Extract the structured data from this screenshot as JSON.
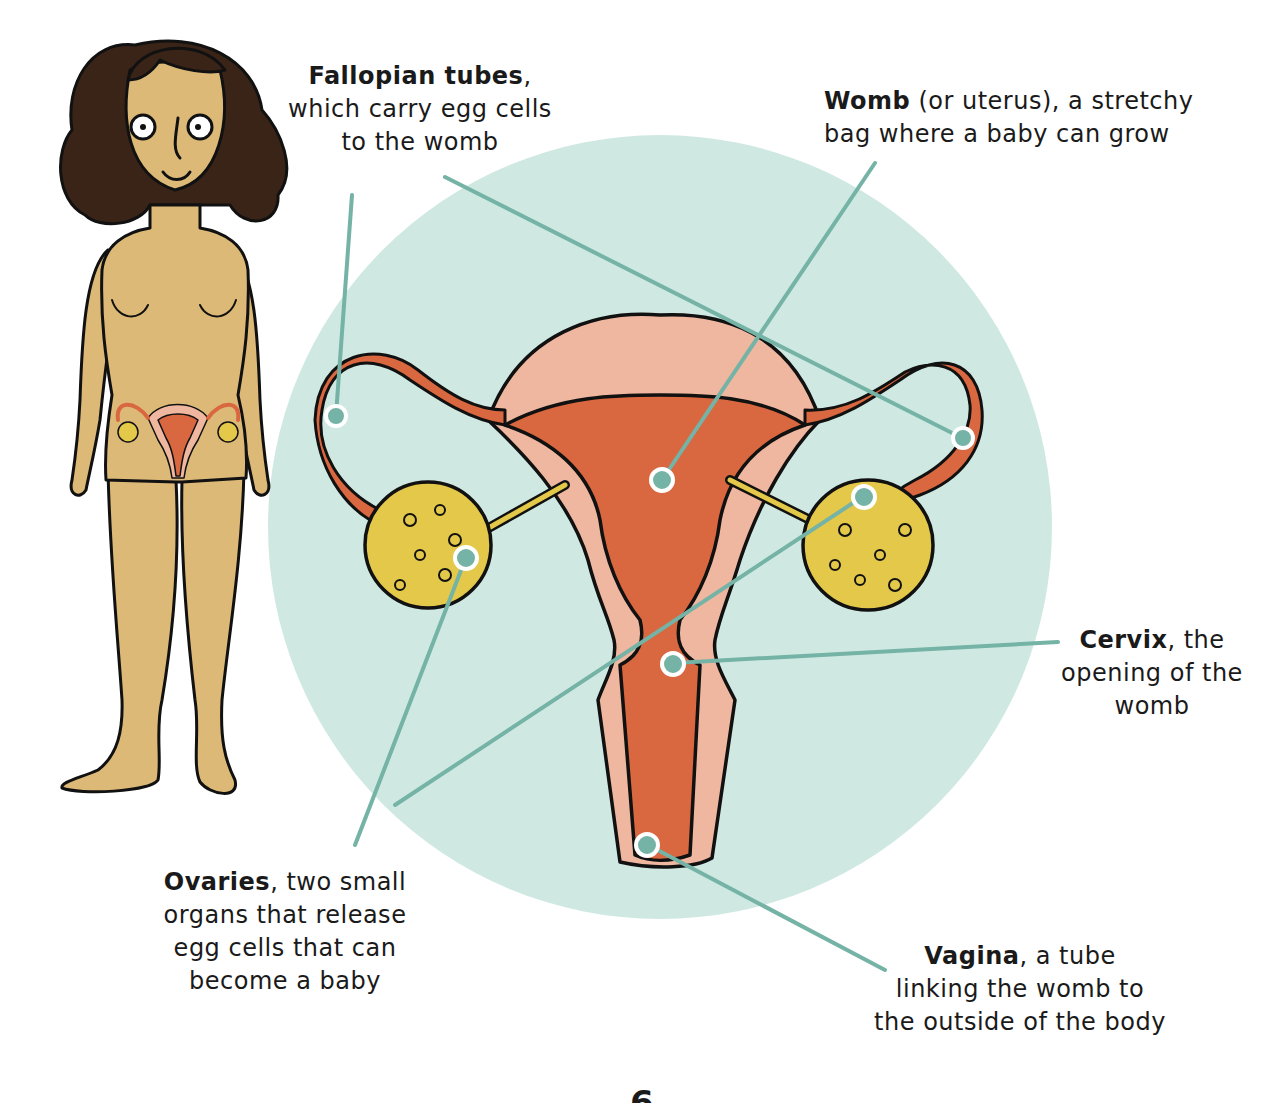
{
  "colors": {
    "background": "#ffffff",
    "circle": "#cfe9e2",
    "pointer_line": "#74b3a5",
    "pointer_dot": "#74b3a5",
    "womb_inner": "#d9673f",
    "womb_outer": "#efb79f",
    "ovary": "#e3c84a",
    "skin": "#ddb977",
    "hair": "#3a2418",
    "outline": "#111111"
  },
  "labels": {
    "fallopian": {
      "term": "Fallopian tubes",
      "rest_line1": ",",
      "line2": "which carry egg cells",
      "line3": "to the womb"
    },
    "womb": {
      "term": "Womb",
      "rest_line1": " (or uterus), a stretchy",
      "line2": "bag where a baby can grow"
    },
    "cervix": {
      "term": "Cervix",
      "rest_line1": ", the",
      "line2": "opening of the",
      "line3": "womb"
    },
    "ovaries": {
      "term": "Ovaries",
      "rest_line1": ", two small",
      "line2": "organs that release",
      "line3": "egg cells that can",
      "line4": "become a baby"
    },
    "vagina": {
      "term": "Vagina",
      "rest_line1": ", a tube",
      "line2": "linking the womb to",
      "line3": "the outside of the body"
    }
  },
  "page_number": "6"
}
